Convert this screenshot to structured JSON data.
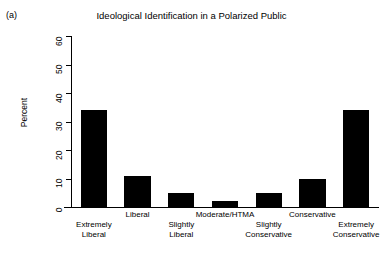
{
  "figure": {
    "panel_label": "(a)",
    "title": "Ideological Identification in a Polarized Public"
  },
  "axes": {
    "ylabel": "Percent",
    "yticks": [
      "0",
      "10",
      "20",
      "30",
      "40",
      "50",
      "60"
    ],
    "xlabels": [
      "Extremely\nLiberal",
      "Liberal",
      "Slightly\nLiberal",
      "Moderate/HTMA",
      "Slightly\nConservative",
      "Conservative",
      "Extremely\nConservative"
    ]
  },
  "style": {
    "bar_color": "#000000",
    "background": "#ffffff",
    "axis_color": "#000000"
  },
  "chart_data": {
    "type": "bar",
    "title": "Ideological Identification in a Polarized Public",
    "xlabel": "",
    "ylabel": "Percent",
    "ylim": [
      0,
      60
    ],
    "yticks": [
      0,
      10,
      20,
      30,
      40,
      50,
      60
    ],
    "grid": false,
    "legend": "none",
    "categories": [
      "Extremely Liberal",
      "Liberal",
      "Slightly Liberal",
      "Moderate/HTMA",
      "Slightly Conservative",
      "Conservative",
      "Extremely Conservative"
    ],
    "values": [
      34,
      11,
      5,
      2,
      5,
      10,
      34
    ]
  }
}
